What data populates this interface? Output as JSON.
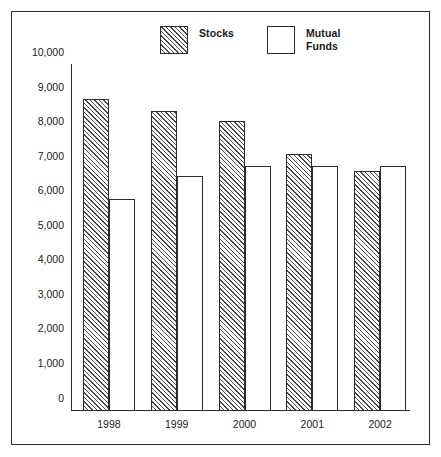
{
  "chart_data": {
    "type": "bar",
    "title": "",
    "xlabel": "",
    "ylabel": "",
    "ylim": [
      0,
      10000
    ],
    "grid": false,
    "legend_position": "top-center",
    "categories": [
      "1998",
      "1999",
      "2000",
      "2001",
      "2002"
    ],
    "y_ticks": [
      "0",
      "1,000",
      "2,000",
      "3,000",
      "4,000",
      "5,000",
      "6,000",
      "7,000",
      "8,000",
      "9,000",
      "10,000"
    ],
    "y_tick_values": [
      0,
      1000,
      2000,
      3000,
      4000,
      5000,
      6000,
      7000,
      8000,
      9000,
      10000
    ],
    "series": [
      {
        "name": "Stocks",
        "pattern": "diagonal-hatch",
        "values": [
          9000,
          8650,
          8350,
          7400,
          6900
        ]
      },
      {
        "name": "Mutual Funds",
        "pattern": "solid-white",
        "values": [
          6100,
          6750,
          7050,
          7050,
          7050
        ]
      }
    ]
  },
  "legend": {
    "stocks": {
      "label": "Stocks",
      "swatch": "hatched-square-icon"
    },
    "mutual_funds": {
      "label": "Mutual\nFunds",
      "swatch": "empty-square-icon"
    }
  },
  "colors": {
    "frame": "#2b2b2b",
    "axis": "#2b2b2b",
    "hatch": "#4a4a4a",
    "background": "#ffffff",
    "text": "#1a1a1a"
  }
}
